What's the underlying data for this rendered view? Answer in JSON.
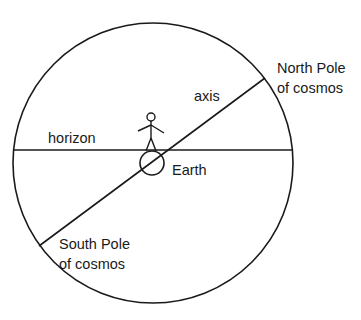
{
  "diagram": {
    "labels": {
      "north_pole_line1": "North Pole",
      "north_pole_line2": "of cosmos",
      "axis": "axis",
      "horizon": "horizon",
      "earth": "Earth",
      "south_pole_line1": "South Pole",
      "south_pole_line2": "of cosmos"
    },
    "colors": {
      "stroke": "#1a1a1a",
      "background": "#ffffff"
    }
  }
}
